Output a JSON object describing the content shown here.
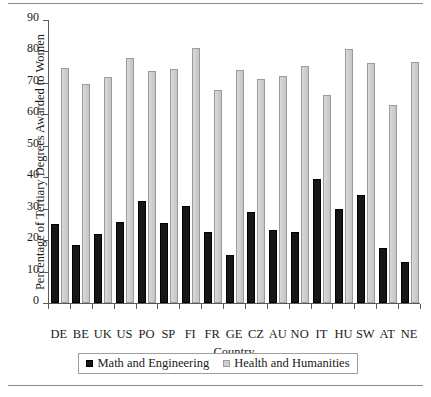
{
  "chart_data": {
    "type": "bar",
    "title": "",
    "xlabel": "Country",
    "ylabel": "Percentage of Tertiary Degrees Awarded to Women",
    "ylim": [
      0,
      90
    ],
    "yticks": [
      0,
      10,
      20,
      30,
      40,
      50,
      60,
      70,
      80,
      90
    ],
    "grid": false,
    "legend_position": "bottom",
    "categories": [
      "DE",
      "BE",
      "UK",
      "US",
      "PO",
      "SP",
      "FI",
      "FR",
      "GE",
      "CZ",
      "AU",
      "NO",
      "IT",
      "HU",
      "SW",
      "AT",
      "NE"
    ],
    "series": [
      {
        "name": "Math and Engineering",
        "color": "#161616",
        "values": [
          25,
          18.3,
          22,
          25.8,
          32.4,
          25.4,
          30.8,
          22.7,
          15.2,
          29,
          23.3,
          22.7,
          39.5,
          30,
          34.2,
          17.4,
          13.1
        ]
      },
      {
        "name": "Health and Humanities",
        "color": "#cfcfcf",
        "values": [
          74.8,
          69.8,
          72,
          77.8,
          73.9,
          74.3,
          81,
          67.8,
          74.2,
          71.4,
          72.2,
          75.5,
          66.1,
          80.8,
          76.4,
          62.9,
          76.7
        ]
      }
    ]
  },
  "legend": {
    "items": [
      {
        "label": "Math and Engineering",
        "swatch": "black-square-icon"
      },
      {
        "label": "Health and Humanities",
        "swatch": "gray-square-icon"
      }
    ]
  }
}
